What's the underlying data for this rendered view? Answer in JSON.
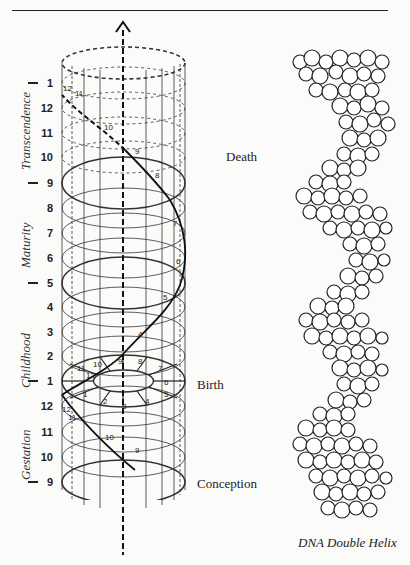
{
  "figure": {
    "left_diagram": {
      "axis_ticks": [
        {
          "label": "1",
          "y": 83,
          "major": true
        },
        {
          "label": "12",
          "y": 108,
          "major": false
        },
        {
          "label": "11",
          "y": 133,
          "major": false
        },
        {
          "label": "10",
          "y": 157,
          "major": false
        },
        {
          "label": "9",
          "y": 183,
          "major": true
        },
        {
          "label": "8",
          "y": 208,
          "major": false
        },
        {
          "label": "7",
          "y": 233,
          "major": false
        },
        {
          "label": "6",
          "y": 258,
          "major": false
        },
        {
          "label": "5",
          "y": 283,
          "major": true
        },
        {
          "label": "4",
          "y": 307,
          "major": false
        },
        {
          "label": "3",
          "y": 332,
          "major": false
        },
        {
          "label": "2",
          "y": 356,
          "major": false
        },
        {
          "label": "1",
          "y": 381,
          "major": true
        },
        {
          "label": "12",
          "y": 406,
          "major": false
        },
        {
          "label": "11",
          "y": 432,
          "major": false
        },
        {
          "label": "10",
          "y": 457,
          "major": false
        },
        {
          "label": "9",
          "y": 482,
          "major": true
        }
      ],
      "stages": [
        {
          "label": "Transcendence",
          "y_bottom": 170
        },
        {
          "label": "Maturity",
          "y_bottom": 268
        },
        {
          "label": "Childhood",
          "y_bottom": 388
        },
        {
          "label": "Gestation",
          "y_bottom": 480
        }
      ],
      "events": [
        {
          "label": "Death",
          "x": 226,
          "y": 149
        },
        {
          "label": "Birth",
          "x": 197,
          "y": 377
        },
        {
          "label": "Conception",
          "x": 197,
          "y": 476
        }
      ],
      "spiral_labels": {
        "upper": [
          "12",
          "11",
          "10",
          "9",
          "8",
          "7",
          "6",
          "5",
          "4"
        ],
        "birth_disc": [
          "1",
          "2",
          "3",
          "4",
          "5",
          "6",
          "7",
          "8",
          "9",
          "10",
          "11",
          "12"
        ],
        "lower": [
          "12",
          "11",
          "10",
          "9"
        ]
      }
    },
    "right_diagram": {
      "caption": "DNA Double Helix"
    }
  }
}
